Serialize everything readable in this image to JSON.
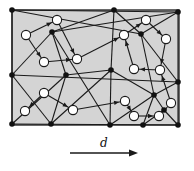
{
  "diagram": {
    "background_fill": "#d4d4d4",
    "edge_color": "#1a1a1a",
    "black_node_color": "#111111",
    "white_node_fill": "#ffffff",
    "direction_label": "d",
    "border": {
      "x": 12,
      "y": 10,
      "w": 167,
      "h": 115
    },
    "black_nodes": [
      [
        12,
        10
      ],
      [
        114,
        10
      ],
      [
        178,
        12
      ],
      [
        52,
        32
      ],
      [
        141,
        34
      ],
      [
        12,
        75
      ],
      [
        66,
        75
      ],
      [
        111,
        70
      ],
      [
        178,
        82
      ],
      [
        154,
        95
      ],
      [
        164,
        110
      ],
      [
        12,
        124
      ],
      [
        51,
        124
      ],
      [
        110,
        125
      ],
      [
        143,
        125
      ],
      [
        178,
        125
      ]
    ],
    "white_nodes": [
      [
        57,
        20
      ],
      [
        26,
        35
      ],
      [
        44,
        62
      ],
      [
        77,
        59
      ],
      [
        146,
        20
      ],
      [
        166,
        39
      ],
      [
        124,
        35
      ],
      [
        134,
        69
      ],
      [
        160,
        70
      ],
      [
        44,
        93
      ],
      [
        25,
        111
      ],
      [
        73,
        110
      ],
      [
        125,
        101
      ],
      [
        171,
        103
      ],
      [
        134,
        116
      ],
      [
        159,
        116
      ]
    ],
    "edges": [
      [
        12,
        10,
        141,
        34
      ],
      [
        12,
        10,
        178,
        12
      ],
      [
        52,
        32,
        12,
        75
      ],
      [
        52,
        32,
        66,
        75
      ],
      [
        52,
        32,
        114,
        10
      ],
      [
        52,
        32,
        110,
        125
      ],
      [
        114,
        10,
        141,
        34
      ],
      [
        114,
        10,
        111,
        70
      ],
      [
        178,
        12,
        141,
        34
      ],
      [
        141,
        34,
        178,
        82
      ],
      [
        141,
        34,
        154,
        95
      ],
      [
        52,
        32,
        178,
        12
      ],
      [
        12,
        75,
        178,
        82
      ],
      [
        66,
        75,
        12,
        124
      ],
      [
        66,
        75,
        51,
        124
      ],
      [
        66,
        75,
        111,
        70
      ],
      [
        111,
        70,
        154,
        95
      ],
      [
        111,
        70,
        110,
        125
      ],
      [
        111,
        70,
        51,
        124
      ],
      [
        178,
        82,
        154,
        95
      ],
      [
        154,
        95,
        143,
        125
      ],
      [
        154,
        95,
        110,
        125
      ],
      [
        154,
        95,
        164,
        110
      ],
      [
        164,
        110,
        178,
        125
      ],
      [
        164,
        110,
        143,
        125
      ],
      [
        12,
        75,
        51,
        124
      ],
      [
        12,
        10,
        12,
        124
      ],
      [
        178,
        12,
        178,
        125
      ],
      [
        12,
        124,
        178,
        125
      ]
    ],
    "arrows": [
      [
        26,
        35,
        57,
        20
      ],
      [
        57,
        20,
        77,
        59
      ],
      [
        26,
        35,
        44,
        62
      ],
      [
        44,
        62,
        77,
        59
      ],
      [
        77,
        59,
        124,
        35
      ],
      [
        124,
        35,
        146,
        20
      ],
      [
        146,
        20,
        166,
        39
      ],
      [
        166,
        39,
        160,
        70
      ],
      [
        160,
        70,
        134,
        69
      ],
      [
        134,
        69,
        124,
        35
      ],
      [
        44,
        93,
        25,
        111
      ],
      [
        44,
        93,
        73,
        110
      ],
      [
        73,
        110,
        125,
        101
      ],
      [
        125,
        101,
        134,
        116
      ],
      [
        134,
        116,
        159,
        116
      ],
      [
        159,
        116,
        171,
        103
      ],
      [
        171,
        103,
        160,
        70
      ]
    ],
    "arrow": {
      "x1": 70,
      "y1": 153,
      "x2": 138,
      "y2": 153
    }
  }
}
